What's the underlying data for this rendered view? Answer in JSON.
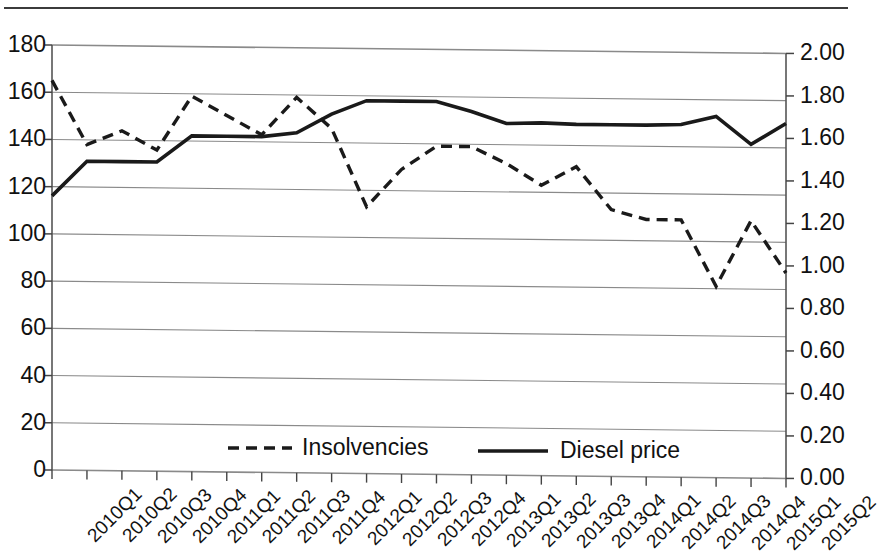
{
  "chart_data": {
    "type": "line",
    "title": "",
    "subtitle": "",
    "xlabel": "",
    "ylabel": "",
    "grid": true,
    "legend_position": "bottom-inside",
    "categories": [
      "2010Q1",
      "2010Q2",
      "2010Q3",
      "2010Q4",
      "2011Q1",
      "2011Q2",
      "2011Q3",
      "2011Q4",
      "2012Q1",
      "2012Q2",
      "2012Q3",
      "2012Q4",
      "2013Q1",
      "2013Q2",
      "2013Q3",
      "2013Q4",
      "2014Q1",
      "2014Q2",
      "2014Q3",
      "2014Q4",
      "2015Q1",
      "2015Q2"
    ],
    "axes": {
      "left": {
        "label": "",
        "ylim": [
          0,
          180
        ],
        "tick_step": 20,
        "ticks": [
          "0",
          "20",
          "40",
          "60",
          "80",
          "100",
          "120",
          "140",
          "160",
          "180"
        ],
        "series": "Insolvencies"
      },
      "right": {
        "label": "",
        "ylim": [
          0.0,
          2.0
        ],
        "tick_step": 0.2,
        "ticks": [
          "0.00",
          "0.20",
          "0.40",
          "0.60",
          "0.80",
          "1.00",
          "1.20",
          "1.40",
          "1.60",
          "1.80",
          "2.00"
        ],
        "series": "Diesel price"
      }
    },
    "series": [
      {
        "name": "Insolvencies",
        "axis": "left",
        "style": "dashed",
        "color": "#1a1a1a",
        "values": [
          165,
          138,
          144,
          136,
          159,
          151,
          143,
          159,
          146,
          113,
          129,
          139,
          139,
          132,
          123,
          131,
          113,
          109,
          109,
          81,
          109,
          87
        ]
      },
      {
        "name": "Diesel price",
        "axis": "right",
        "style": "solid",
        "color": "#1a1a1a",
        "values": [
          1.29,
          1.455,
          1.455,
          1.455,
          1.58,
          1.58,
          1.58,
          1.6,
          1.69,
          1.755,
          1.755,
          1.755,
          1.71,
          1.655,
          1.66,
          1.655,
          1.655,
          1.655,
          1.66,
          1.7,
          1.57,
          1.67
        ]
      }
    ]
  },
  "legend": {
    "items": [
      {
        "label": "Insolvencies",
        "style": "dashed"
      },
      {
        "label": "Diesel price",
        "style": "solid"
      }
    ]
  }
}
